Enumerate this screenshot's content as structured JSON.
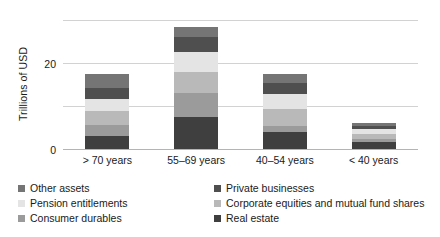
{
  "chart_data": {
    "type": "bar",
    "subtype": "stacked-vertical",
    "title": "",
    "xlabel": "",
    "ylabel": "Trillions of USD",
    "ylim": [
      0,
      60
    ],
    "yticks": [
      0,
      20,
      40,
      60
    ],
    "ytick_labels": [
      "0",
      "20",
      "40",
      "60"
    ],
    "grid": true,
    "grid_axis": "y",
    "legend_position": "bottom",
    "legend_columns": 2,
    "categories": [
      "> 70 years",
      "55–69 years",
      "40–54 years",
      "< 40 years"
    ],
    "stack_order_bottom_to_top": [
      "Real estate",
      "Consumer durables",
      "Corporate equities and mutual fund shares",
      "Pension entitlements",
      "Private businesses",
      "Other assets"
    ],
    "series": [
      {
        "name": "Real estate",
        "color": "#3f3f3f",
        "values": [
          6.0,
          14.8,
          7.8,
          3.2
        ]
      },
      {
        "name": "Consumer durables",
        "color": "#9b9b9b",
        "values": [
          5.1,
          11.1,
          2.8,
          1.4
        ]
      },
      {
        "name": "Corporate equities and mutual fund shares",
        "color": "#b9b9b9",
        "values": [
          6.5,
          9.7,
          7.8,
          2.3
        ]
      },
      {
        "name": "Pension entitlements",
        "color": "#e4e4e4",
        "values": [
          5.5,
          9.7,
          7.4,
          2.3
        ]
      },
      {
        "name": "Private businesses",
        "color": "#4f4f4f",
        "values": [
          5.5,
          6.9,
          5.1,
          1.4
        ]
      },
      {
        "name": "Other assets",
        "color": "#757575",
        "values": [
          6.4,
          4.8,
          4.1,
          1.4
        ]
      }
    ],
    "totals": [
      35.0,
      57.0,
      35.0,
      12.0
    ]
  },
  "legend": {
    "items": [
      {
        "label": "Other assets",
        "color": "#757575"
      },
      {
        "label": "Private businesses",
        "color": "#4f4f4f"
      },
      {
        "label": "Pension entitlements",
        "color": "#e4e4e4"
      },
      {
        "label": "Corporate equities and mutual fund shares",
        "color": "#b9b9b9"
      },
      {
        "label": "Consumer durables",
        "color": "#9b9b9b"
      },
      {
        "label": "Real estate",
        "color": "#3f3f3f"
      }
    ]
  }
}
